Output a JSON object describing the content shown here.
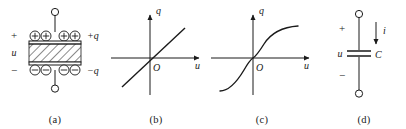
{
  "figure": {
    "type": "physics-figure",
    "background_color": "#ffffff",
    "line_color": "#1a1a1a"
  },
  "panels": [
    {
      "id": "a",
      "sublabel": "(a)",
      "title": "parallel-plate capacitor with dielectric",
      "labels": {
        "plus_sign": "+",
        "minus_sign": "−",
        "voltage": "u",
        "charge_positive": "+q",
        "charge_negative": "−q"
      },
      "top_plate_charges": [
        "+",
        "+",
        "+",
        "+"
      ],
      "bottom_plate_charges": [
        "−",
        "−",
        "−",
        "−"
      ],
      "dielectric_hatching": "diagonal"
    },
    {
      "id": "b",
      "sublabel": "(b)",
      "title": "linear capacitor characteristic",
      "axes": {
        "y_label": "q",
        "x_label": "u",
        "origin_label": "O"
      },
      "curve": "straight line through origin, positive slope"
    },
    {
      "id": "c",
      "sublabel": "(c)",
      "title": "nonlinear capacitor characteristic",
      "axes": {
        "y_label": "q",
        "x_label": "u",
        "origin_label": "O"
      },
      "curve": "S-shaped monotonic curve through origin, saturating"
    },
    {
      "id": "d",
      "sublabel": "(d)",
      "title": "capacitor circuit symbol",
      "labels": {
        "plus_sign": "+",
        "minus_sign": "−",
        "voltage": "u",
        "capacitance": "C",
        "current": "i"
      },
      "current_direction": "downward"
    }
  ]
}
